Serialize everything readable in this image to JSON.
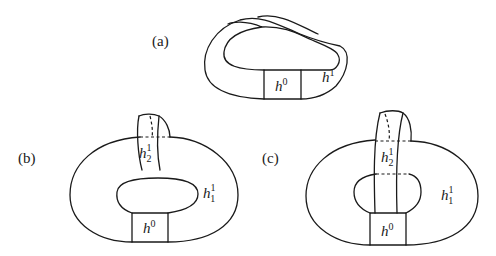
{
  "figure": {
    "panels": [
      {
        "id": "a",
        "label": "(a)",
        "handles": {
          "zero": {
            "base": "h",
            "sup": "0"
          },
          "one": {
            "base": "h",
            "sup": "1"
          }
        }
      },
      {
        "id": "b",
        "label": "(b)",
        "handles": {
          "zero": {
            "base": "h",
            "sup": "0"
          },
          "one_1": {
            "base": "h",
            "sup": "1",
            "sub": "1"
          },
          "one_2": {
            "base": "h",
            "sup": "1",
            "sub": "2"
          }
        }
      },
      {
        "id": "c",
        "label": "(c)",
        "handles": {
          "zero": {
            "base": "h",
            "sup": "0"
          },
          "one_1": {
            "base": "h",
            "sup": "1",
            "sub": "1"
          },
          "one_2": {
            "base": "h",
            "sup": "1",
            "sub": "2"
          }
        }
      }
    ],
    "colors": {
      "ink": "#1a1a1a",
      "background": "#ffffff"
    }
  }
}
